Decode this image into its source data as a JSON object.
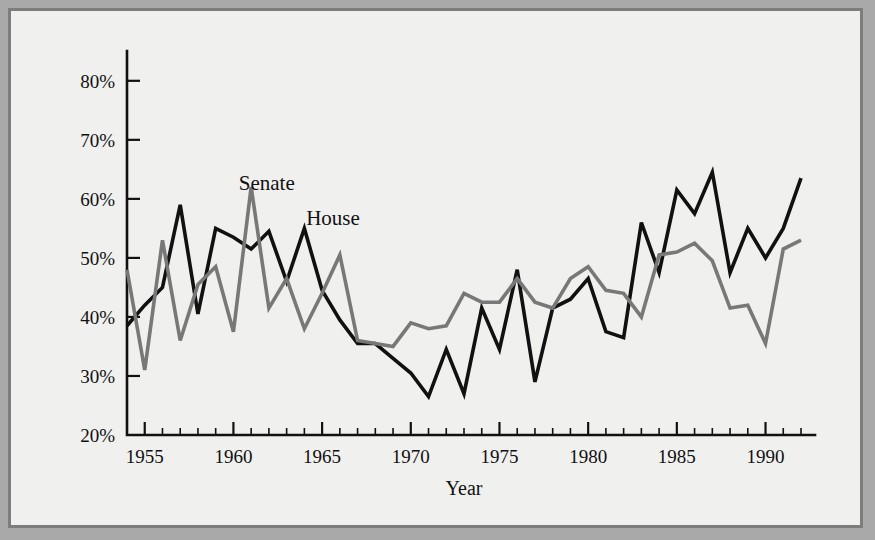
{
  "figure": {
    "background_color": "#f0f0ee",
    "frame_color": "#7d7d7d",
    "page_color": "#a9a9a9"
  },
  "chart_data": {
    "type": "line",
    "title": "",
    "subtitle": "",
    "xlabel": "Year",
    "ylabel": "",
    "xlim": [
      1954,
      1992
    ],
    "ylim": [
      20,
      82
    ],
    "ytick_labels": [
      "20%",
      "30%",
      "40%",
      "50%",
      "60%",
      "70%",
      "80%"
    ],
    "ytick_values": [
      20,
      30,
      40,
      50,
      60,
      70,
      80
    ],
    "xtick_labels": [
      "1955",
      "1960",
      "1965",
      "1970",
      "1975",
      "1980",
      "1985",
      "1990"
    ],
    "xtick_values": [
      1955,
      1960,
      1965,
      1970,
      1975,
      1980,
      1985,
      1990
    ],
    "minor_xticks_every": 1,
    "grid": false,
    "legend_position": "inline-annotations",
    "x": [
      1954,
      1955,
      1956,
      1957,
      1958,
      1959,
      1960,
      1961,
      1962,
      1963,
      1964,
      1965,
      1966,
      1967,
      1968,
      1969,
      1970,
      1971,
      1972,
      1973,
      1974,
      1975,
      1976,
      1977,
      1978,
      1979,
      1980,
      1981,
      1982,
      1983,
      1984,
      1985,
      1986,
      1987,
      1988,
      1989,
      1990,
      1991,
      1992
    ],
    "series": [
      {
        "name": "House",
        "color": "#111111",
        "width": 3.6,
        "annotation_label": "House",
        "annotation_x": 1964.1,
        "annotation_y": 55.5,
        "values": [
          38.5,
          42.0,
          45.0,
          59.0,
          40.5,
          55.0,
          53.5,
          51.5,
          54.5,
          46.0,
          55.0,
          44.5,
          39.5,
          35.5,
          35.5,
          33.0,
          30.5,
          26.5,
          34.5,
          27.0,
          41.5,
          34.5,
          48.0,
          29.0,
          41.5,
          43.0,
          46.5,
          37.5,
          36.5,
          56.0,
          47.5,
          61.5,
          57.5,
          64.5,
          47.5,
          55.0,
          50.0,
          55.0,
          63.5
        ]
      },
      {
        "name": "Senate",
        "color": "#787878",
        "width": 3.6,
        "annotation_label": "Senate",
        "annotation_x": 1960.3,
        "annotation_y": 61.5,
        "values": [
          48.0,
          31.0,
          53.0,
          36.0,
          45.5,
          48.5,
          37.5,
          62.0,
          41.5,
          46.5,
          38.0,
          44.0,
          50.5,
          36.0,
          35.5,
          35.0,
          39.0,
          38.0,
          38.5,
          44.0,
          42.5,
          42.5,
          46.5,
          42.5,
          41.5,
          46.5,
          48.5,
          44.5,
          44.0,
          40.0,
          50.5,
          51.0,
          52.5,
          49.5,
          41.5,
          42.0,
          35.5,
          51.5,
          53.0
        ]
      }
    ]
  }
}
